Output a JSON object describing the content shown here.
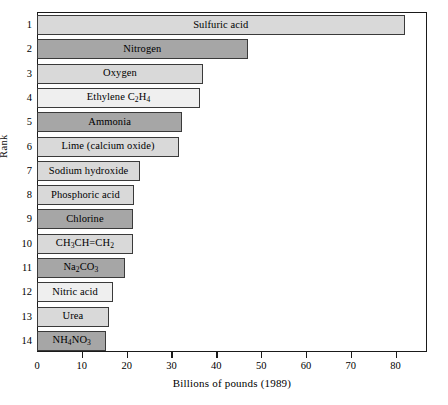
{
  "chart_data": {
    "type": "bar",
    "orientation": "horizontal",
    "title": "",
    "xlabel": "Billions of pounds (1989)",
    "ylabel": "Rank",
    "xlim": [
      0,
      87
    ],
    "xticks": [
      0,
      10,
      20,
      30,
      40,
      50,
      60,
      70,
      80
    ],
    "xtick_labels": [
      "0",
      "10",
      "20",
      "30",
      "40",
      "50",
      "60",
      "70",
      "80"
    ],
    "grid": false,
    "legend": null,
    "categories": [
      "1",
      "2",
      "3",
      "4",
      "5",
      "6",
      "7",
      "8",
      "9",
      "10",
      "11",
      "12",
      "13",
      "14"
    ],
    "bars": [
      {
        "rank": "1",
        "label": "Sulfuric acid",
        "label_html": "Sulfuric acid",
        "value": 82.0,
        "shade": "light",
        "label_inside": true
      },
      {
        "rank": "2",
        "label": "Nitrogen",
        "label_html": "Nitrogen",
        "value": 47.0,
        "shade": "dark",
        "label_inside": true
      },
      {
        "rank": "3",
        "label": "Oxygen",
        "label_html": "Oxygen",
        "value": 37.0,
        "shade": "light",
        "label_inside": true
      },
      {
        "rank": "4",
        "label": "Ethylene C2H4",
        "label_html": "Ethylene C<sub>2</sub>H<sub>4</sub>",
        "value": 36.4,
        "shade": "lighter",
        "label_inside": true
      },
      {
        "rank": "5",
        "label": "Ammonia",
        "label_html": "Ammonia",
        "value": 32.4,
        "shade": "dark",
        "label_inside": true
      },
      {
        "rank": "6",
        "label": "Lime (calcium oxide)",
        "label_html": "Lime (calcium oxide)",
        "value": 31.7,
        "shade": "light",
        "label_inside": true
      },
      {
        "rank": "7",
        "label": "Sodium hydroxide",
        "label_html": "Sodium hydroxide",
        "value": 23.0,
        "shade": "light",
        "label_inside": true
      },
      {
        "rank": "8",
        "label": "Phosphoric acid",
        "label_html": "Phosphoric acid",
        "value": 21.6,
        "shade": "light",
        "label_inside": true
      },
      {
        "rank": "9",
        "label": "Chlorine",
        "label_html": "Chlorine",
        "value": 21.4,
        "shade": "dark",
        "label_inside": true
      },
      {
        "rank": "10",
        "label": "CH3CH=CH2",
        "label_html": "CH<sub>3</sub>CH=CH<sub>2</sub>",
        "value": 21.4,
        "shade": "light",
        "label_inside": true
      },
      {
        "rank": "11",
        "label": "Na2CO3",
        "label_html": "Na<sub>2</sub>CO<sub>3</sub>",
        "value": 19.6,
        "shade": "dark",
        "label_inside": true
      },
      {
        "rank": "12",
        "label": "Nitric acid",
        "label_html": "Nitric acid",
        "value": 17.0,
        "shade": "lighter",
        "label_inside": true
      },
      {
        "rank": "13",
        "label": "Urea",
        "label_html": "Urea",
        "value": 16.0,
        "shade": "light",
        "label_inside": true
      },
      {
        "rank": "14",
        "label": "NH4NO3",
        "label_html": "NH<sub>4</sub>NO<sub>3</sub>",
        "value": 15.5,
        "shade": "dark",
        "label_inside": true
      }
    ]
  }
}
